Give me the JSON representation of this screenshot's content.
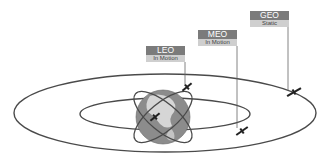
{
  "diagram": {
    "orbits": [
      {
        "name": "LEO",
        "status": "In Motion"
      },
      {
        "name": "MEO",
        "status": "In Motion"
      },
      {
        "name": "GEO",
        "status": "Static"
      }
    ],
    "colors": {
      "label_header": "#7b7b7b",
      "label_status": "#cfcfcf",
      "orbit_line": "#4a4a4a",
      "globe": "#8a8a8a"
    }
  }
}
